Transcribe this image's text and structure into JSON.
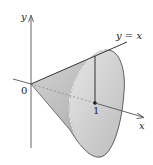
{
  "figure": {
    "type": "solid-of-revolution-cone",
    "labels": {
      "y_axis": "y",
      "x_axis": "x",
      "origin": "0",
      "line": "y = x",
      "tick": "1"
    },
    "colors": {
      "axis": "#555555",
      "outline": "#444444",
      "surface_light": "#e4e4e4",
      "surface_mid": "#c8c8c8",
      "surface_dark": "#9a9a9a",
      "highlight_arc": "#f4f4f4",
      "background": "#ffffff"
    }
  }
}
